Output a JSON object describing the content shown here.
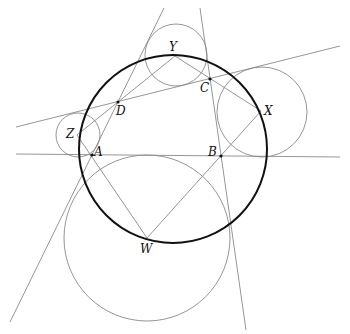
{
  "diagram": {
    "colors": {
      "thin": "#8a8a8a",
      "thick": "#111111",
      "background": "#ffffff"
    },
    "points": {
      "A": {
        "label": "A",
        "x": 92,
        "y": 155
      },
      "B": {
        "label": "B",
        "x": 221,
        "y": 156
      },
      "C": {
        "label": "C",
        "x": 210,
        "y": 79
      },
      "D": {
        "label": "D",
        "x": 118,
        "y": 102
      },
      "W": {
        "label": "W",
        "x": 147,
        "y": 238
      },
      "X": {
        "label": "X",
        "x": 261,
        "y": 111
      },
      "Y": {
        "label": "Y",
        "x": 175,
        "y": 56
      },
      "Z": {
        "label": "Z",
        "x": 77,
        "y": 135
      }
    },
    "circles": [
      {
        "name": "circumcircle-WXYZ",
        "cx": 173,
        "cy": 149,
        "r": 94,
        "style": "thick"
      },
      {
        "name": "circle-W",
        "cx": 147,
        "cy": 238,
        "r": 83,
        "style": "thin"
      },
      {
        "name": "circle-X",
        "cx": 262,
        "cy": 112,
        "r": 45,
        "style": "thin"
      },
      {
        "name": "circle-Y",
        "cx": 176,
        "cy": 55,
        "r": 31,
        "style": "thin"
      },
      {
        "name": "circle-Z",
        "cx": 78,
        "cy": 135,
        "r": 22,
        "style": "thin"
      }
    ],
    "lines": [
      {
        "name": "line-AB",
        "x1": 16,
        "y1": 154,
        "x2": 340,
        "y2": 157
      },
      {
        "name": "line-DC",
        "x1": 16,
        "y1": 127,
        "x2": 340,
        "y2": 46
      },
      {
        "name": "line-AD",
        "x1": 10,
        "y1": 322,
        "x2": 164,
        "y2": 8
      },
      {
        "name": "line-BC",
        "x1": 200,
        "y1": 8,
        "x2": 246,
        "y2": 330
      }
    ],
    "segments": [
      {
        "name": "segment-ZD",
        "from": "Z",
        "to": "D"
      },
      {
        "name": "segment-ZW",
        "from": "Z",
        "to": "W"
      },
      {
        "name": "segment-YD",
        "from": "Y",
        "to": "D"
      },
      {
        "name": "segment-YX",
        "from": "Y",
        "to": "X"
      },
      {
        "name": "segment-XW",
        "from": "X",
        "to": "W"
      }
    ]
  }
}
